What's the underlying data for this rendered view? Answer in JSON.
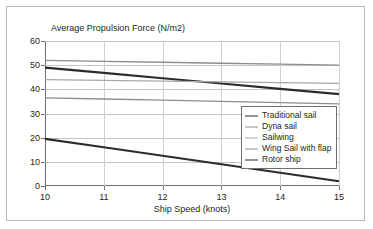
{
  "chart_data": {
    "type": "line",
    "title": "",
    "xlabel": "Ship Speed (knots)",
    "ylabel": "Average Propulsion Force (N/m2)",
    "x": [
      10,
      11,
      12,
      13,
      14,
      15
    ],
    "xlim": [
      10,
      15
    ],
    "ylim": [
      0,
      60
    ],
    "xticks": [
      "10",
      "11",
      "12",
      "13",
      "14",
      "15"
    ],
    "yticks": [
      "60",
      "50",
      "40",
      "30",
      "20",
      "10",
      "0"
    ],
    "ytick_values": [
      60,
      50,
      40,
      30,
      20,
      10,
      0
    ],
    "grid": "horizontal",
    "legend_position": "lower-right-inside",
    "series": [
      {
        "name": "Traditional sail",
        "values": [
          49.0,
          46.8,
          44.6,
          42.4,
          40.2,
          38.0
        ],
        "color": "#2b2b2b",
        "width": 2.1
      },
      {
        "name": "Dyna sail",
        "values": [
          52.0,
          51.6,
          51.2,
          50.8,
          50.4,
          50.0
        ],
        "color": "#8d8d8d",
        "width": 1.3
      },
      {
        "name": "Sailwing",
        "values": [
          44.0,
          43.7,
          43.4,
          43.1,
          42.8,
          42.5
        ],
        "color": "#a8a8a8",
        "width": 1.3
      },
      {
        "name": "Wing Sail with flap",
        "values": [
          36.5,
          36.0,
          35.5,
          35.0,
          34.5,
          34.0
        ],
        "color": "#8d8d8d",
        "width": 1.3
      },
      {
        "name": "Rotor ship",
        "values": [
          19.5,
          16.0,
          12.5,
          9.0,
          5.5,
          2.0
        ],
        "color": "#2b2b2b",
        "width": 2.1
      }
    ]
  },
  "frame": {
    "border_color": "#b9b9b9"
  }
}
